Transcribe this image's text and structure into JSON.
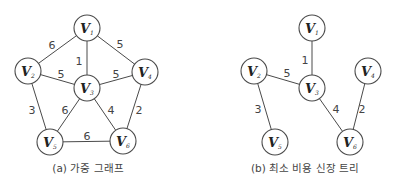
{
  "figures": [
    {
      "id": "a",
      "caption": "(a) 가중 그래프",
      "caption_pos": [
        88,
        172
      ],
      "nodes": [
        {
          "name": "V",
          "sub": "1",
          "x": 87,
          "y": 28
        },
        {
          "name": "V",
          "sub": "2",
          "x": 28,
          "y": 71
        },
        {
          "name": "V",
          "sub": "3",
          "x": 87,
          "y": 88
        },
        {
          "name": "V",
          "sub": "4",
          "x": 145,
          "y": 72
        },
        {
          "name": "V",
          "sub": "5",
          "x": 50,
          "y": 142
        },
        {
          "name": "V",
          "sub": "6",
          "x": 123,
          "y": 141
        }
      ],
      "edges": [
        {
          "from": 0,
          "to": 1,
          "weight": "6",
          "lx": 52,
          "ly": 49
        },
        {
          "from": 0,
          "to": 2,
          "weight": "1",
          "lx": 79,
          "ly": 65
        },
        {
          "from": 0,
          "to": 3,
          "weight": "5",
          "lx": 120,
          "ly": 48
        },
        {
          "from": 1,
          "to": 2,
          "weight": "5",
          "lx": 61,
          "ly": 78
        },
        {
          "from": 2,
          "to": 3,
          "weight": "5",
          "lx": 116,
          "ly": 78
        },
        {
          "from": 1,
          "to": 4,
          "weight": "3",
          "lx": 32,
          "ly": 114
        },
        {
          "from": 2,
          "to": 4,
          "weight": "6",
          "lx": 65,
          "ly": 114
        },
        {
          "from": 2,
          "to": 5,
          "weight": "4",
          "lx": 111,
          "ly": 114
        },
        {
          "from": 3,
          "to": 5,
          "weight": "2",
          "lx": 139,
          "ly": 114
        },
        {
          "from": 4,
          "to": 5,
          "weight": "6",
          "lx": 87,
          "ly": 140
        }
      ]
    },
    {
      "id": "b",
      "caption": "(b) 최소 비용 신장 트리",
      "caption_pos": [
        305,
        172
      ],
      "nodes": [
        {
          "name": "V",
          "sub": "1",
          "x": 312,
          "y": 28
        },
        {
          "name": "V",
          "sub": "2",
          "x": 254,
          "y": 71
        },
        {
          "name": "V",
          "sub": "3",
          "x": 312,
          "y": 88
        },
        {
          "name": "V",
          "sub": "4",
          "x": 368,
          "y": 71
        },
        {
          "name": "V",
          "sub": "5",
          "x": 275,
          "y": 142
        },
        {
          "name": "V",
          "sub": "6",
          "x": 350,
          "y": 142
        }
      ],
      "edges": [
        {
          "from": 0,
          "to": 2,
          "weight": "1",
          "lx": 305,
          "ly": 64
        },
        {
          "from": 1,
          "to": 2,
          "weight": "5",
          "lx": 287,
          "ly": 77
        },
        {
          "from": 1,
          "to": 4,
          "weight": "3",
          "lx": 258,
          "ly": 113
        },
        {
          "from": 2,
          "to": 5,
          "weight": "4",
          "lx": 336,
          "ly": 113
        },
        {
          "from": 3,
          "to": 5,
          "weight": "2",
          "lx": 362,
          "ly": 113
        }
      ]
    }
  ],
  "node_radius": 13,
  "colors": {
    "stroke": "#4a4a4a",
    "text": "#222222",
    "weight_text": "#444444",
    "background": "#ffffff"
  }
}
